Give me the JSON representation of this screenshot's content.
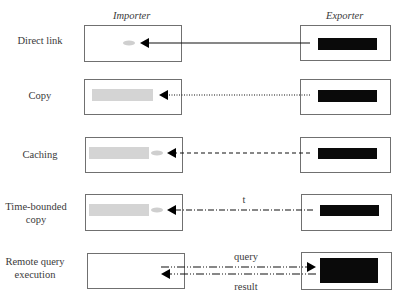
{
  "headers": {
    "importer": "Importer",
    "exporter": "Exporter"
  },
  "rows": [
    {
      "label": "Direct link",
      "line_style": "solid"
    },
    {
      "label": "Copy",
      "line_style": "dotted"
    },
    {
      "label": "Caching",
      "line_style": "dashed"
    },
    {
      "label": "Time-bounded copy",
      "line_style": "dash-dot",
      "annotation": "t"
    },
    {
      "label": "Remote query execution",
      "line_style": "dash-dot-dot",
      "annotations": {
        "query": "query",
        "result": "result"
      }
    }
  ],
  "colors": {
    "data_block": "#0a0a0a",
    "copy_block": "#d4d4d4",
    "pointer": "#cfcfcf",
    "border": "#707070"
  }
}
